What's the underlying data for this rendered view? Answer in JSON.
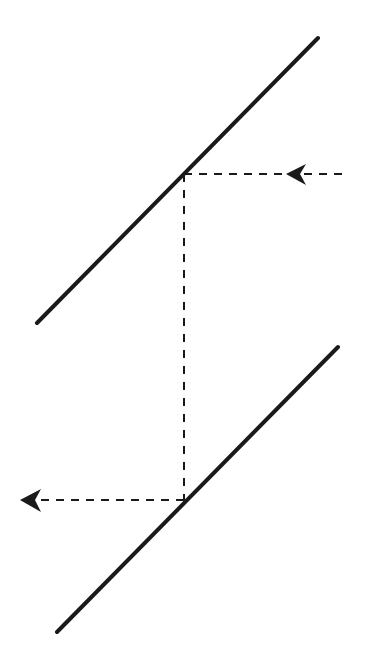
{
  "diagram": {
    "width": 379,
    "height": 668,
    "background": "#ffffff",
    "stroke_color": "#1a1a1a",
    "mirrors": [
      {
        "name": "upper-mirror",
        "x1": 37,
        "y1": 323,
        "x2": 318,
        "y2": 38,
        "stroke_width": 4
      },
      {
        "name": "lower-mirror",
        "x1": 57,
        "y1": 632,
        "x2": 338,
        "y2": 347,
        "stroke_width": 4
      }
    ],
    "ray_segments": [
      {
        "name": "incoming-ray",
        "x1": 342,
        "y1": 174,
        "x2": 184,
        "y2": 174,
        "dash": "8 7",
        "stroke_width": 2
      },
      {
        "name": "vertical-ray",
        "x1": 184,
        "y1": 174,
        "x2": 184,
        "y2": 500,
        "dash": "8 8",
        "stroke_width": 2
      },
      {
        "name": "outgoing-ray",
        "x1": 184,
        "y1": 500,
        "x2": 22,
        "y2": 500,
        "dash": "8 7",
        "stroke_width": 2
      }
    ],
    "arrowheads": [
      {
        "name": "incoming-arrowhead",
        "direction": "left",
        "points": "286,174 306,164 300,174 306,185"
      },
      {
        "name": "outgoing-arrowhead",
        "direction": "left",
        "points": "20,500 41,489 35,500 41,512"
      }
    ]
  }
}
